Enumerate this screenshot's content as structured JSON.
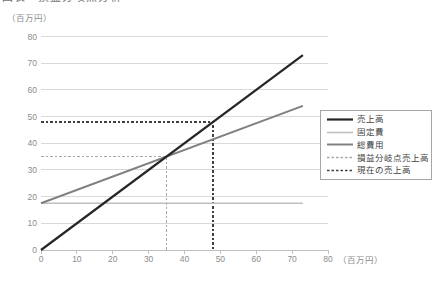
{
  "figure": {
    "title_partial": "図表　損益分岐点分析"
  },
  "chart_data": {
    "type": "line",
    "x_unit_label": "（百万円）",
    "y_unit_label": "（百万円）",
    "xlim": [
      0,
      80
    ],
    "ylim": [
      0,
      80
    ],
    "xticks": [
      0,
      10,
      20,
      30,
      40,
      50,
      60,
      70,
      80
    ],
    "yticks": [
      0,
      10,
      20,
      30,
      40,
      50,
      60,
      70,
      80
    ],
    "grid": "horizontal-only",
    "legend_position": "overlay-right-middle",
    "series": [
      {
        "key": "sales",
        "name": "売上高",
        "color": "#262626",
        "width": 2.2,
        "dash": null,
        "z": 5,
        "points": [
          [
            0,
            0
          ],
          [
            73,
            73
          ]
        ]
      },
      {
        "key": "fixed",
        "name": "固定費",
        "color": "#bfbfbf",
        "width": 1.6,
        "dash": null,
        "z": 3,
        "points": [
          [
            0,
            17.5
          ],
          [
            73,
            17.5
          ]
        ]
      },
      {
        "key": "total",
        "name": "総費用",
        "color": "#808080",
        "width": 2.0,
        "dash": null,
        "z": 4,
        "points": [
          [
            0,
            17.5
          ],
          [
            73,
            54
          ]
        ]
      },
      {
        "key": "break_even_guide",
        "name": "損益分岐点売上高",
        "color": "#a6a6a6",
        "width": 1.6,
        "dash": "2.5 2",
        "z": 1,
        "points": [
          [
            0,
            35
          ],
          [
            35,
            35
          ],
          [
            35,
            0
          ]
        ]
      },
      {
        "key": "current_guide",
        "name": "現在の売上高",
        "color": "#404040",
        "width": 1.6,
        "dash": "2.5 2",
        "z": 2,
        "points": [
          [
            0,
            48
          ],
          [
            48,
            48
          ],
          [
            48,
            0
          ]
        ]
      }
    ],
    "annotations": {
      "break_even_point_sales": 35,
      "current_sales": 48,
      "fixed_cost": 17.5,
      "variable_cost_ratio": 0.5
    }
  },
  "colors": {
    "grid": "#d9d9d9",
    "axis": "#bfbfbf",
    "tick_label": "#8c8c8c",
    "legend_border": "#a6a6a6",
    "legend_text": "#404040"
  }
}
